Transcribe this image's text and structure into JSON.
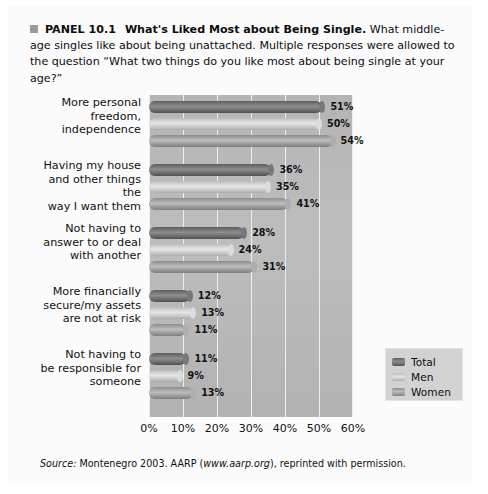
{
  "panel": {
    "bullet_icon": "square-bullet",
    "label": "PANEL 10.1",
    "title": "What's Liked Most about Being Single.",
    "description": "What middle-age singles like about being unattached. Multiple responses were allowed to the question “What two things do you like most about being single at your age?”",
    "source_prefix": "Source:",
    "source_text_1": " Montenegro 2003. AARP (",
    "source_italic": "www.aarp.org",
    "source_text_2": "), reprinted with permission."
  },
  "colors": {
    "total": "#6b6b6b",
    "men": "#d8d8d8",
    "women": "#a3a3a3",
    "plot_background": "#b8b8b8",
    "gridline": "#eeeeee",
    "panel_background": "#fbfbfb",
    "bullet": "#9a9a9a"
  },
  "chart_data": {
    "type": "bar",
    "orientation": "horizontal",
    "title": "What's Liked Most about Being Single",
    "xlabel": "",
    "ylabel": "",
    "xlim": [
      0,
      60
    ],
    "xticks": [
      "0%",
      "10%",
      "20%",
      "30%",
      "40%",
      "50%",
      "60%"
    ],
    "xtick_values": [
      0,
      10,
      20,
      30,
      40,
      50,
      60
    ],
    "grid": true,
    "legend_position": "inside-lower-right",
    "value_suffix": "%",
    "categories": [
      "More personal freedom, independence",
      "Having my house and other things the way I want them",
      "Not having to answer to or deal with another",
      "More financially secure/my assets are not at risk",
      "Not having to be responsible for someone"
    ],
    "category_lines": [
      [
        "More personal",
        "freedom,",
        "independence"
      ],
      [
        "Having my house",
        "and other things the",
        "way I want them"
      ],
      [
        "Not having to",
        "answer to or deal",
        "with another"
      ],
      [
        "More financially",
        "secure/my assets",
        "are not at risk"
      ],
      [
        "Not having to",
        "be responsible for",
        "someone"
      ]
    ],
    "series": [
      {
        "name": "Total",
        "values": [
          51,
          36,
          28,
          12,
          11
        ],
        "labels": [
          "51%",
          "36%",
          "28%",
          "12%",
          "11%"
        ]
      },
      {
        "name": "Men",
        "values": [
          50,
          35,
          24,
          13,
          9
        ],
        "labels": [
          "50%",
          "35%",
          "24%",
          "13%",
          "9%"
        ]
      },
      {
        "name": "Women",
        "values": [
          54,
          41,
          31,
          11,
          13
        ],
        "labels": [
          "54%",
          "41%",
          "31%",
          "11%",
          "13%"
        ]
      }
    ]
  }
}
